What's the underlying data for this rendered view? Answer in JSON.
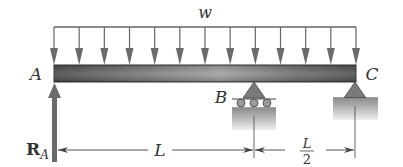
{
  "diagram": {
    "type": "beam-free-body",
    "load": {
      "label": "w",
      "kind": "uniformly-distributed",
      "arrow_count": 13
    },
    "points": {
      "A": {
        "label": "A",
        "support": "none (reaction shown)"
      },
      "B": {
        "label": "B",
        "support": "roller"
      },
      "C": {
        "label": "C",
        "support": "pin"
      }
    },
    "reaction": {
      "label_main": "R",
      "label_sub": "A",
      "direction": "up"
    },
    "dimensions": [
      {
        "label": "L",
        "from": "A",
        "to": "B"
      },
      {
        "label_num": "L",
        "label_den": "2",
        "from": "B",
        "to": "C"
      }
    ],
    "colors": {
      "line": "#555555",
      "arrow_fill": "#6b6b6b",
      "beam_dark": "#4a4a4a",
      "beam_light": "#9a9a9a",
      "support_fill": "#7a7a7a",
      "ground_dark": "#8c8c8c",
      "ground_light": "#e6e6e6",
      "text": "#333333"
    }
  }
}
